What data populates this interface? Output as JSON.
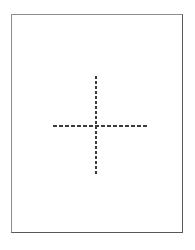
{
  "figure": {
    "name": "dashed-crosshair-figure",
    "canvas": {
      "width": 195,
      "height": 250,
      "background_color": "#ffffff"
    },
    "frame": {
      "label": "",
      "left": 11,
      "top": 14,
      "width": 172,
      "height": 219,
      "border_width": 1,
      "border_color_light": "#8c8c8c",
      "border_color_dark": "#58585a",
      "fill_color": "#ffffff"
    },
    "crosshair": {
      "label": "",
      "center_x": 96,
      "center_y": 126,
      "line_color": "#3a3a3c",
      "line_style": "dashed",
      "horizontal": {
        "label": "",
        "x_start": 53,
        "x_end": 148,
        "y": 126,
        "thickness": 2,
        "dash_length": 4,
        "gap_length": 2
      },
      "vertical": {
        "label": "",
        "y_start": 76,
        "y_end": 175,
        "x": 96,
        "thickness": 2,
        "dash_length": 3,
        "gap_length": 2
      }
    }
  }
}
